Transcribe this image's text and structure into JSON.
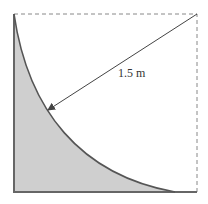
{
  "figure": {
    "radius_label": "1.5 m",
    "colors": {
      "shade": "#cfcfcf",
      "stroke": "#555555",
      "dashed": "#888888",
      "arrow": "#444444"
    }
  }
}
